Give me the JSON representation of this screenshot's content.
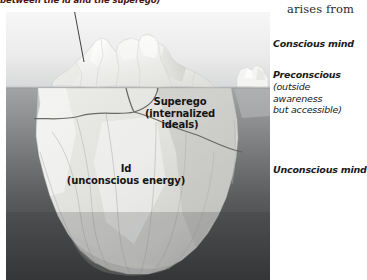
{
  "figure": {
    "type": "freud-iceberg-model",
    "top_caption": "between the id and the superego)",
    "serif_note": "arises from",
    "iceberg_labels": {
      "superego": {
        "title": "Superego",
        "line2": "(internalized",
        "line3": "ideals)"
      },
      "id": {
        "title": "Id",
        "line2": "(unconscious energy)"
      }
    },
    "side_labels": [
      {
        "name": "conscious-mind",
        "head": "Conscious mind",
        "sub": []
      },
      {
        "name": "preconscious",
        "head": "Preconscious",
        "sub": [
          "(outside",
          "awareness",
          "but accessible)"
        ]
      },
      {
        "name": "unconscious-mind",
        "head": "Unconscious mind",
        "sub": []
      }
    ]
  },
  "colors": {
    "sky_top": "#f4f4f4",
    "sky_bottom": "#d9dadb",
    "water_top": "#9a9b9c",
    "water_bottom": "#3b3c3e",
    "ice_light": "#f2f2f0",
    "ice_mid": "#dcdcd9",
    "ice_shadow": "#c6c6c3",
    "crack_line": "#6e6e6c",
    "caption_red": "#4a1510",
    "text_dark": "#141414",
    "waterline": "#8f9092"
  },
  "geometry": {
    "panel": {
      "x": 6,
      "y": 12,
      "w": 264,
      "h": 268
    },
    "waterline_y": 76,
    "leader_line": {
      "x1": 72,
      "y1": 0,
      "x2": 84,
      "y2": 62
    }
  }
}
